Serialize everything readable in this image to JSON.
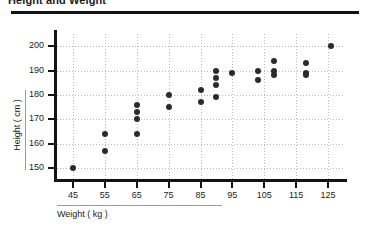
{
  "chart_data": {
    "type": "scatter",
    "title": "Height and Weight",
    "xlabel": "Weight ( kg )",
    "ylabel": "Height ( cm )",
    "xlim": [
      40,
      130
    ],
    "ylim": [
      145,
      205
    ],
    "xticks": [
      45,
      55,
      65,
      75,
      85,
      95,
      105,
      115,
      125
    ],
    "yticks": [
      150,
      160,
      170,
      180,
      190,
      200
    ],
    "grid": true,
    "legend": "none",
    "marker_color": "#2b2b2b",
    "points": [
      {
        "x": 45,
        "y": 150
      },
      {
        "x": 55,
        "y": 164
      },
      {
        "x": 55,
        "y": 157
      },
      {
        "x": 65,
        "y": 176
      },
      {
        "x": 65,
        "y": 173
      },
      {
        "x": 65,
        "y": 170
      },
      {
        "x": 65,
        "y": 164
      },
      {
        "x": 75,
        "y": 180
      },
      {
        "x": 75,
        "y": 175
      },
      {
        "x": 85,
        "y": 182
      },
      {
        "x": 85,
        "y": 177
      },
      {
        "x": 90,
        "y": 190
      },
      {
        "x": 90,
        "y": 187
      },
      {
        "x": 90,
        "y": 184
      },
      {
        "x": 90,
        "y": 179
      },
      {
        "x": 95,
        "y": 189
      },
      {
        "x": 103,
        "y": 190
      },
      {
        "x": 103,
        "y": 186
      },
      {
        "x": 108,
        "y": 194
      },
      {
        "x": 108,
        "y": 190
      },
      {
        "x": 108,
        "y": 188
      },
      {
        "x": 118,
        "y": 193
      },
      {
        "x": 118,
        "y": 189
      },
      {
        "x": 118,
        "y": 188
      },
      {
        "x": 126,
        "y": 200
      }
    ]
  }
}
